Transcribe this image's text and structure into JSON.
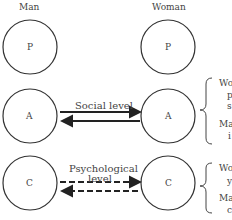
{
  "headers": {
    "left": "Man",
    "right": "Woman"
  },
  "rows": [
    {
      "left": "P",
      "right": "P",
      "label": "",
      "style": "none"
    },
    {
      "left": "A",
      "right": "A",
      "label": "Social level",
      "style": "solid"
    },
    {
      "left": "C",
      "right": "C",
      "label_line1": "Psychological",
      "label_line2": "level",
      "style": "dashed"
    }
  ],
  "annotations": {
    "social": [
      "Wo",
      "p",
      "s",
      "Ma",
      "i"
    ],
    "psychological": [
      "Wo",
      "y",
      "Ma",
      "c"
    ]
  }
}
